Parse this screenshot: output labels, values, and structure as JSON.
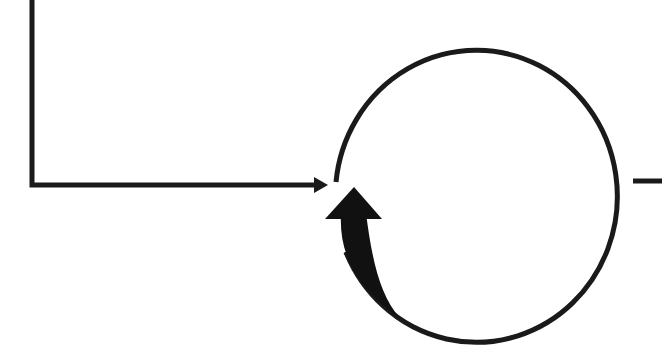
{
  "diagram": {
    "type": "feedback-loop",
    "background": "#ffffff",
    "stroke_color": "#1a1a1a",
    "fill_color": "#111111",
    "elements": [
      {
        "id": "input-line",
        "kind": "elbow-connector",
        "description": "line descending from top-left then running right into the circle with an arrowhead"
      },
      {
        "id": "loop-circle",
        "kind": "circle",
        "description": "large open circle with a gap on the left side"
      },
      {
        "id": "feedback-arrow",
        "kind": "curved-block-arrow",
        "description": "filled curved arrow rising along the lower-left of the circle"
      },
      {
        "id": "output-line",
        "kind": "line",
        "description": "short horizontal line leaving the circle on the right"
      }
    ],
    "labels": []
  }
}
